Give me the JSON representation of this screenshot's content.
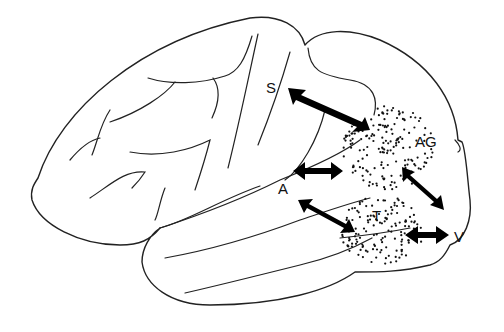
{
  "diagram": {
    "type": "brain-lateral-view",
    "labels": {
      "S": "S",
      "AG": "AG",
      "A": "A",
      "T": "T",
      "V": "V"
    },
    "regions": [
      {
        "id": "AG",
        "name": "angular gyrus region",
        "fill": "stippled"
      },
      {
        "id": "T",
        "name": "temporal region",
        "fill": "stippled"
      }
    ],
    "connections": [
      {
        "from": "S",
        "to": "AG",
        "type": "bidirectional"
      },
      {
        "from": "A",
        "to": "AG",
        "type": "bidirectional"
      },
      {
        "from": "A",
        "to": "T",
        "type": "bidirectional"
      },
      {
        "from": "AG",
        "to": "V",
        "type": "bidirectional"
      },
      {
        "from": "T",
        "to": "V",
        "type": "bidirectional"
      }
    ],
    "colors": {
      "line": "#222222",
      "arrow": "#000000",
      "background": "#ffffff"
    }
  }
}
